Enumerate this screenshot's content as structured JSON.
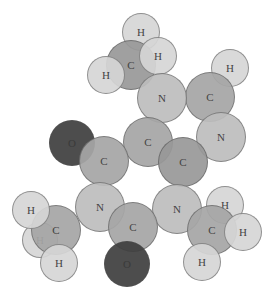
{
  "molecule": {
    "name": "",
    "atoms": [
      {
        "id": "h-back-left",
        "label": "H",
        "el": "H",
        "x": 40,
        "y": 240,
        "r": 18
      },
      {
        "id": "h-top",
        "label": "H",
        "el": "H",
        "x": 141,
        "y": 32,
        "r": 19
      },
      {
        "id": "c-methyl-top",
        "label": "C",
        "el": "C",
        "x": 131,
        "y": 65,
        "r": 25
      },
      {
        "id": "h-top-left",
        "label": "H",
        "el": "H",
        "x": 106,
        "y": 75,
        "r": 19
      },
      {
        "id": "h-top-right",
        "label": "H",
        "el": "H",
        "x": 158,
        "y": 56,
        "r": 19
      },
      {
        "id": "h-ring-right",
        "label": "H",
        "el": "H",
        "x": 230,
        "y": 68,
        "r": 19
      },
      {
        "id": "c-ring-right",
        "label": "C",
        "el": "C",
        "x": 210,
        "y": 97,
        "r": 25
      },
      {
        "id": "n-top",
        "label": "N",
        "el": "N",
        "x": 162,
        "y": 98,
        "r": 25
      },
      {
        "id": "n-right",
        "label": "N",
        "el": "N",
        "x": 221,
        "y": 137,
        "r": 25
      },
      {
        "id": "c-center",
        "label": "C",
        "el": "C",
        "x": 148,
        "y": 142,
        "r": 25
      },
      {
        "id": "c-center-right",
        "label": "C",
        "el": "C",
        "x": 183,
        "y": 162,
        "r": 25
      },
      {
        "id": "o-left",
        "label": "O",
        "el": "O",
        "x": 72,
        "y": 143,
        "r": 23
      },
      {
        "id": "c-left",
        "label": "C",
        "el": "C",
        "x": 104,
        "y": 161,
        "r": 25
      },
      {
        "id": "h-back-right",
        "label": "H",
        "el": "H",
        "x": 225,
        "y": 205,
        "r": 19
      },
      {
        "id": "n-bottom-left",
        "label": "N",
        "el": "N",
        "x": 100,
        "y": 207,
        "r": 25
      },
      {
        "id": "n-bottom-right",
        "label": "N",
        "el": "N",
        "x": 177,
        "y": 209,
        "r": 25
      },
      {
        "id": "c-methyl-left",
        "label": "C",
        "el": "C",
        "x": 56,
        "y": 230,
        "r": 25
      },
      {
        "id": "h-left-top",
        "label": "H",
        "el": "H",
        "x": 31,
        "y": 210,
        "r": 19
      },
      {
        "id": "h-left-bottom",
        "label": "H",
        "el": "H",
        "x": 59,
        "y": 263,
        "r": 19
      },
      {
        "id": "c-bottom",
        "label": "C",
        "el": "C",
        "x": 133,
        "y": 227,
        "r": 25
      },
      {
        "id": "o-bottom",
        "label": "O",
        "el": "O",
        "x": 127,
        "y": 264,
        "r": 23
      },
      {
        "id": "c-methyl-right",
        "label": "C",
        "el": "C",
        "x": 212,
        "y": 230,
        "r": 25
      },
      {
        "id": "h-right",
        "label": "H",
        "el": "H",
        "x": 243,
        "y": 232,
        "r": 19
      },
      {
        "id": "h-right-bottom",
        "label": "H",
        "el": "H",
        "x": 202,
        "y": 262,
        "r": 19
      }
    ],
    "colors": {
      "H": "#d6d6d6",
      "C": "#a6a6a6",
      "N": "#bdbdbd",
      "O": "#3e3e3e",
      "C-dark": "#989898"
    }
  }
}
